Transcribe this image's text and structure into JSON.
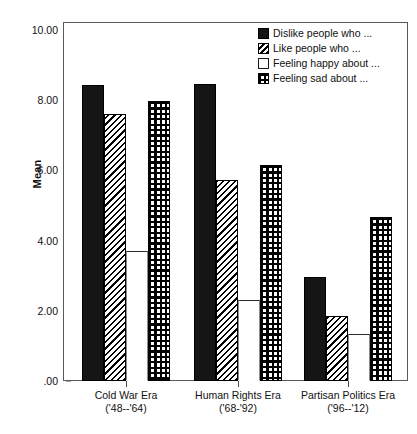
{
  "chart_data": {
    "type": "bar",
    "title": "",
    "subtitle": "",
    "xlabel": "",
    "ylabel": "Mean",
    "ylim": [
      0,
      10
    ],
    "ytick_labels": [
      "10.00",
      "8.00",
      "6.00",
      "4.00",
      "2.00",
      ".00"
    ],
    "ytick_values": [
      10,
      8,
      6,
      4,
      2,
      0
    ],
    "grid": false,
    "legend_position": "top-right",
    "categories": [
      "Cold War Era ('48--'64)",
      "Human Rights Era ('68-'92)",
      "Partisan Politics Era ('96--'12)"
    ],
    "category_lines": [
      {
        "line1": "Cold War Era",
        "line2": "('48--'64)"
      },
      {
        "line1": "Human Rights Era",
        "line2": "('68-'92)"
      },
      {
        "line1": "Partisan Politics Era",
        "line2": "('96--'12)"
      }
    ],
    "series": [
      {
        "name": "Dislike people who ...",
        "fill": "solid",
        "values": [
          8.42,
          8.45,
          2.95
        ]
      },
      {
        "name": "Like people who ...",
        "fill": "hatch",
        "values": [
          7.6,
          5.72,
          1.85
        ]
      },
      {
        "name": "Feeling happy about ...",
        "fill": "white",
        "values": [
          3.7,
          2.3,
          1.35
        ]
      },
      {
        "name": "Feeling sad about ...",
        "fill": "checker",
        "values": [
          7.97,
          6.15,
          4.68
        ]
      }
    ]
  },
  "axis": {
    "y_title": "Mean"
  },
  "legend": {
    "entries": [
      {
        "label": "Dislike people who ...",
        "swatch": "solid-black-swatch"
      },
      {
        "label": "Like people who ...",
        "swatch": "diagonal-hatch-swatch"
      },
      {
        "label": "Feeling happy about ...",
        "swatch": "white-swatch"
      },
      {
        "label": "Feeling sad about ...",
        "swatch": "checkerboard-swatch"
      }
    ]
  },
  "colors": {
    "bar_solid": "#151515",
    "bar_outline": "#000000",
    "frame": "#5a5a5a",
    "text": "#111111",
    "background": "#ffffff"
  }
}
